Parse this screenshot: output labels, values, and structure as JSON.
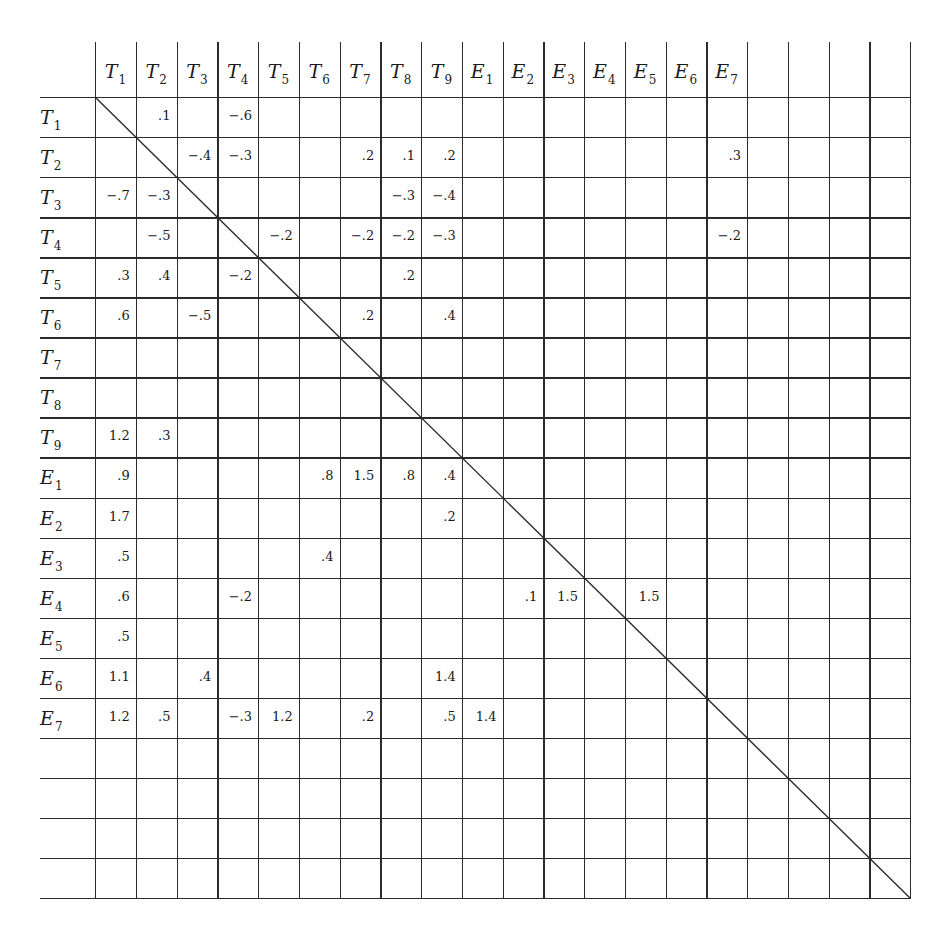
{
  "document": {
    "type": "correlation/adjacency matrix with diagonal",
    "total_columns": 20,
    "total_rows": 20
  },
  "column_headers": [
    {
      "letter": "T",
      "sub": "1"
    },
    {
      "letter": "T",
      "sub": "2"
    },
    {
      "letter": "T",
      "sub": "3"
    },
    {
      "letter": "T",
      "sub": "4"
    },
    {
      "letter": "T",
      "sub": "5"
    },
    {
      "letter": "T",
      "sub": "6"
    },
    {
      "letter": "T",
      "sub": "7"
    },
    {
      "letter": "T",
      "sub": "8"
    },
    {
      "letter": "T",
      "sub": "9"
    },
    {
      "letter": "E",
      "sub": "1"
    },
    {
      "letter": "E",
      "sub": "2"
    },
    {
      "letter": "E",
      "sub": "3"
    },
    {
      "letter": "E",
      "sub": "4"
    },
    {
      "letter": "E",
      "sub": "5"
    },
    {
      "letter": "E",
      "sub": "6"
    },
    {
      "letter": "E",
      "sub": "7"
    },
    {
      "letter": "",
      "sub": ""
    },
    {
      "letter": "",
      "sub": ""
    },
    {
      "letter": "",
      "sub": ""
    },
    {
      "letter": "",
      "sub": ""
    }
  ],
  "row_headers": [
    {
      "letter": "T",
      "sub": "1"
    },
    {
      "letter": "T",
      "sub": "2"
    },
    {
      "letter": "T",
      "sub": "3"
    },
    {
      "letter": "T",
      "sub": "4"
    },
    {
      "letter": "T",
      "sub": "5"
    },
    {
      "letter": "T",
      "sub": "6"
    },
    {
      "letter": "T",
      "sub": "7"
    },
    {
      "letter": "T",
      "sub": "8"
    },
    {
      "letter": "T",
      "sub": "9"
    },
    {
      "letter": "E",
      "sub": "1"
    },
    {
      "letter": "E",
      "sub": "2"
    },
    {
      "letter": "E",
      "sub": "3"
    },
    {
      "letter": "E",
      "sub": "4"
    },
    {
      "letter": "E",
      "sub": "5"
    },
    {
      "letter": "E",
      "sub": "6"
    },
    {
      "letter": "E",
      "sub": "7"
    },
    {
      "letter": "",
      "sub": ""
    },
    {
      "letter": "",
      "sub": ""
    },
    {
      "letter": "",
      "sub": ""
    },
    {
      "letter": "",
      "sub": ""
    }
  ],
  "cells": [
    {
      "row": "T1",
      "col": "T2",
      "r": 0,
      "c": 1,
      "value": ".1"
    },
    {
      "row": "T1",
      "col": "T4",
      "r": 0,
      "c": 3,
      "value": "−.6"
    },
    {
      "row": "T2",
      "col": "T3",
      "r": 1,
      "c": 2,
      "value": "−.4"
    },
    {
      "row": "T2",
      "col": "T4",
      "r": 1,
      "c": 3,
      "value": "−.3"
    },
    {
      "row": "T2",
      "col": "T7",
      "r": 1,
      "c": 6,
      "value": ".2"
    },
    {
      "row": "T2",
      "col": "T8",
      "r": 1,
      "c": 7,
      "value": ".1"
    },
    {
      "row": "T2",
      "col": "T9",
      "r": 1,
      "c": 8,
      "value": ".2"
    },
    {
      "row": "T2",
      "col": "E7",
      "r": 1,
      "c": 15,
      "value": ".3"
    },
    {
      "row": "T3",
      "col": "T1",
      "r": 2,
      "c": 0,
      "value": "−.7"
    },
    {
      "row": "T3",
      "col": "T2",
      "r": 2,
      "c": 1,
      "value": "−.3"
    },
    {
      "row": "T3",
      "col": "T8",
      "r": 2,
      "c": 7,
      "value": "−.3"
    },
    {
      "row": "T3",
      "col": "T9",
      "r": 2,
      "c": 8,
      "value": "−.4"
    },
    {
      "row": "T4",
      "col": "T2",
      "r": 3,
      "c": 1,
      "value": "−.5"
    },
    {
      "row": "T4",
      "col": "T5",
      "r": 3,
      "c": 4,
      "value": "−.2"
    },
    {
      "row": "T4",
      "col": "T7",
      "r": 3,
      "c": 6,
      "value": "−.2"
    },
    {
      "row": "T4",
      "col": "T8",
      "r": 3,
      "c": 7,
      "value": "−.2"
    },
    {
      "row": "T4",
      "col": "T9",
      "r": 3,
      "c": 8,
      "value": "−.3"
    },
    {
      "row": "T4",
      "col": "E7",
      "r": 3,
      "c": 15,
      "value": "−.2"
    },
    {
      "row": "T5",
      "col": "T1",
      "r": 4,
      "c": 0,
      "value": ".3"
    },
    {
      "row": "T5",
      "col": "T2",
      "r": 4,
      "c": 1,
      "value": ".4"
    },
    {
      "row": "T5",
      "col": "T4",
      "r": 4,
      "c": 3,
      "value": "−.2"
    },
    {
      "row": "T5",
      "col": "T8",
      "r": 4,
      "c": 7,
      "value": ".2"
    },
    {
      "row": "T6",
      "col": "T1",
      "r": 5,
      "c": 0,
      "value": ".6"
    },
    {
      "row": "T6",
      "col": "T3",
      "r": 5,
      "c": 2,
      "value": "−.5"
    },
    {
      "row": "T6",
      "col": "T7",
      "r": 5,
      "c": 6,
      "value": ".2"
    },
    {
      "row": "T6",
      "col": "T9",
      "r": 5,
      "c": 8,
      "value": ".4"
    },
    {
      "row": "T9",
      "col": "T1",
      "r": 8,
      "c": 0,
      "value": "1.2"
    },
    {
      "row": "T9",
      "col": "T2",
      "r": 8,
      "c": 1,
      "value": ".3"
    },
    {
      "row": "E1",
      "col": "T1",
      "r": 9,
      "c": 0,
      "value": ".9"
    },
    {
      "row": "E1",
      "col": "T6",
      "r": 9,
      "c": 5,
      "value": ".8"
    },
    {
      "row": "E1",
      "col": "T7",
      "r": 9,
      "c": 6,
      "value": "1.5"
    },
    {
      "row": "E1",
      "col": "T8",
      "r": 9,
      "c": 7,
      "value": ".8"
    },
    {
      "row": "E1",
      "col": "T9",
      "r": 9,
      "c": 8,
      "value": ".4"
    },
    {
      "row": "E2",
      "col": "T1",
      "r": 10,
      "c": 0,
      "value": "1.7"
    },
    {
      "row": "E2",
      "col": "T9",
      "r": 10,
      "c": 8,
      "value": ".2"
    },
    {
      "row": "E3",
      "col": "T1",
      "r": 11,
      "c": 0,
      "value": ".5"
    },
    {
      "row": "E3",
      "col": "T6",
      "r": 11,
      "c": 5,
      "value": ".4"
    },
    {
      "row": "E4",
      "col": "T1",
      "r": 12,
      "c": 0,
      "value": ".6"
    },
    {
      "row": "E4",
      "col": "T4",
      "r": 12,
      "c": 3,
      "value": "−.2"
    },
    {
      "row": "E4",
      "col": "E2",
      "r": 12,
      "c": 10,
      "value": ".1"
    },
    {
      "row": "E4",
      "col": "E3",
      "r": 12,
      "c": 11,
      "value": "1.5"
    },
    {
      "row": "E4",
      "col": "E5",
      "r": 12,
      "c": 13,
      "value": "1.5"
    },
    {
      "row": "E5",
      "col": "T1",
      "r": 13,
      "c": 0,
      "value": ".5"
    },
    {
      "row": "E6",
      "col": "T1",
      "r": 14,
      "c": 0,
      "value": "1.1"
    },
    {
      "row": "E6",
      "col": "T3",
      "r": 14,
      "c": 2,
      "value": ".4"
    },
    {
      "row": "E6",
      "col": "T9",
      "r": 14,
      "c": 8,
      "value": "1.4"
    },
    {
      "row": "E7",
      "col": "T1",
      "r": 15,
      "c": 0,
      "value": "1.2"
    },
    {
      "row": "E7",
      "col": "T2",
      "r": 15,
      "c": 1,
      "value": ".5"
    },
    {
      "row": "E7",
      "col": "T4",
      "r": 15,
      "c": 3,
      "value": "−.3"
    },
    {
      "row": "E7",
      "col": "T5",
      "r": 15,
      "c": 4,
      "value": "1.2"
    },
    {
      "row": "E7",
      "col": "T7",
      "r": 15,
      "c": 6,
      "value": ".2"
    },
    {
      "row": "E7",
      "col": "T9",
      "r": 15,
      "c": 8,
      "value": ".5"
    },
    {
      "row": "E7",
      "col": "E1",
      "r": 15,
      "c": 9,
      "value": "1.4"
    }
  ],
  "colors": {
    "line": "#2b2b2b",
    "text": "#1a1a1a",
    "background": "#ffffff"
  }
}
